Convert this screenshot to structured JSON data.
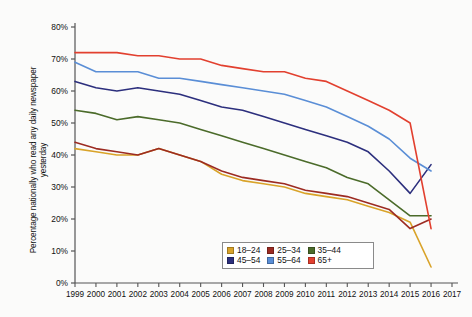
{
  "chart_data": {
    "type": "line",
    "title": "",
    "xlabel": "",
    "ylabel": "Percentage nationally who read any daily newspaper yesterday",
    "x": [
      1999,
      2000,
      2001,
      2002,
      2003,
      2004,
      2005,
      2006,
      2007,
      2008,
      2009,
      2010,
      2011,
      2012,
      2013,
      2014,
      2015,
      2016
    ],
    "xlim": [
      1999,
      2017
    ],
    "ylim": [
      0,
      80
    ],
    "ytick_labels": [
      "0%",
      "10%",
      "20%",
      "30%",
      "40%",
      "50%",
      "60%",
      "70%",
      "80%"
    ],
    "ytick_values": [
      0,
      10,
      20,
      30,
      40,
      50,
      60,
      70,
      80
    ],
    "xtick_labels": [
      "1999",
      "2000",
      "2001",
      "2002",
      "2003",
      "2004",
      "2005",
      "2006",
      "2007",
      "2008",
      "2009",
      "2010",
      "2011",
      "2012",
      "2013",
      "2014",
      "2015",
      "2016",
      "2017"
    ],
    "grid": false,
    "legend_position": "inside-bottom-center",
    "series": [
      {
        "name": "18–24",
        "color": "#d9a329",
        "values": [
          42,
          41,
          40,
          40,
          42,
          40,
          38,
          34,
          32,
          31,
          30,
          28,
          27,
          26,
          24,
          22,
          19,
          5
        ]
      },
      {
        "name": "25–34",
        "color": "#9c2b22",
        "values": [
          44,
          42,
          41,
          40,
          42,
          40,
          38,
          35,
          33,
          32,
          31,
          29,
          28,
          27,
          25,
          23,
          17,
          20
        ]
      },
      {
        "name": "35–44",
        "color": "#4b6b2a",
        "values": [
          54,
          53,
          51,
          52,
          51,
          50,
          48,
          46,
          44,
          42,
          40,
          38,
          36,
          33,
          31,
          26,
          21,
          21
        ]
      },
      {
        "name": "45–54",
        "color": "#2c2f7d",
        "values": [
          63,
          61,
          60,
          61,
          60,
          59,
          57,
          55,
          54,
          52,
          50,
          48,
          46,
          44,
          41,
          35,
          28,
          37
        ]
      },
      {
        "name": "55–64",
        "color": "#5a8ed6",
        "values": [
          69,
          66,
          66,
          66,
          64,
          64,
          63,
          62,
          61,
          60,
          59,
          57,
          55,
          52,
          49,
          45,
          39,
          35
        ]
      },
      {
        "name": "65+",
        "color": "#e2402f",
        "values": [
          72,
          72,
          72,
          71,
          71,
          70,
          70,
          68,
          67,
          66,
          66,
          64,
          63,
          60,
          57,
          54,
          50,
          17
        ]
      }
    ]
  },
  "legend": {
    "items": [
      {
        "label": "18–24",
        "color": "#d9a329"
      },
      {
        "label": "25–34",
        "color": "#9c2b22"
      },
      {
        "label": "35–44",
        "color": "#4b6b2a"
      },
      {
        "label": "45–54",
        "color": "#2c2f7d"
      },
      {
        "label": "55–64",
        "color": "#5a8ed6"
      },
      {
        "label": "65+",
        "color": "#e2402f"
      }
    ]
  }
}
